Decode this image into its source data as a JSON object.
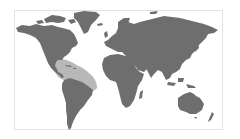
{
  "map": {
    "type": "world-map",
    "projection": "miller",
    "colors": {
      "background": "#ffffff",
      "frame": "#e2e2e2",
      "land": "#6e6e6e",
      "highlight": "#b8b8b8"
    },
    "highlighted_region": "Gulf of Mexico, Caribbean, Central America and north-east coast of South America"
  }
}
